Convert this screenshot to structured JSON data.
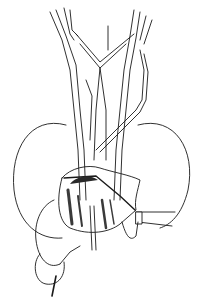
{
  "figure": {
    "kind": "anatomical line illustration",
    "colors": {
      "ink": "#1a1a1a",
      "background": "#ffffff",
      "shade": "#3a3a3a"
    },
    "width": 201,
    "height": 299
  }
}
